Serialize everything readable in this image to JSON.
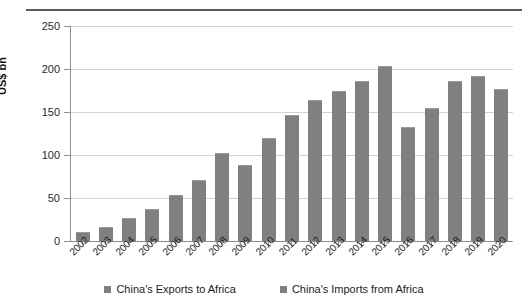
{
  "chart_data": {
    "type": "bar",
    "title": "",
    "xlabel": "",
    "ylabel": "US$ bn",
    "ylim": [
      0,
      250
    ],
    "yticks": [
      0,
      50,
      100,
      150,
      200,
      250
    ],
    "grid": true,
    "legend_position": "bottom",
    "categories": [
      "2002",
      "2003",
      "2004",
      "2005",
      "2006",
      "2007",
      "2008",
      "2009",
      "2010",
      "2011",
      "2012",
      "2013",
      "2014",
      "2015",
      "2016",
      "2017",
      "2018",
      "2019",
      "2020"
    ],
    "series": [
      {
        "name": "China's Exports to Africa",
        "color": "#808080",
        "values": [
          11,
          16,
          27,
          37,
          53,
          71,
          102,
          88,
          120,
          147,
          164,
          174,
          186,
          204,
          133,
          155,
          186,
          192,
          177
        ]
      }
    ],
    "legend": [
      {
        "label": "China's Exports to Africa",
        "color": "#808080"
      },
      {
        "label": "China's Imports from Africa",
        "color": "#808080"
      }
    ]
  }
}
